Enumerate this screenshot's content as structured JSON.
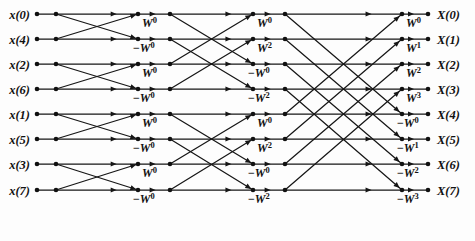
{
  "figure": {
    "name": "fft-butterfly-diagram",
    "width": 475,
    "height": 241,
    "background_color": "#fdfdfd",
    "line_color": "#161616",
    "text_color": "#111111"
  },
  "chart_data": {
    "type": "diagram",
    "n_points": 8,
    "n_stages": 3,
    "inputs": [
      "x(0)",
      "x(4)",
      "x(2)",
      "x(6)",
      "x(1)",
      "x(5)",
      "x(3)",
      "x(7)"
    ],
    "outputs": [
      "X(0)",
      "X(1)",
      "X(2)",
      "X(3)",
      "X(4)",
      "X(5)",
      "X(6)",
      "X(7)"
    ],
    "input_order": "bit-reversed",
    "output_order": "natural",
    "stages": [
      {
        "index": 1,
        "butterfly_span": 1,
        "twiddle_labels": [
          "W^0",
          "-W^0",
          "W^0",
          "-W^0",
          "W^0",
          "-W^0",
          "W^0",
          "-W^0"
        ]
      },
      {
        "index": 2,
        "butterfly_span": 2,
        "twiddle_labels": [
          "W^0",
          "W^2",
          "-W^0",
          "-W^2",
          "W^0",
          "W^2",
          "-W^0",
          "-W^2"
        ]
      },
      {
        "index": 3,
        "butterfly_span": 4,
        "twiddle_labels": [
          "W^0",
          "W^1",
          "W^2",
          "W^3",
          "-W^0",
          "-W^1",
          "-W^2",
          "-W^3"
        ]
      }
    ],
    "twiddle_rows": {
      "stage1": [
        {
          "sign": "",
          "base": "W",
          "exp": "0"
        },
        {
          "sign": "−",
          "base": "W",
          "exp": "0"
        },
        {
          "sign": "",
          "base": "W",
          "exp": "0"
        },
        {
          "sign": "−",
          "base": "W",
          "exp": "0"
        },
        {
          "sign": "",
          "base": "W",
          "exp": "0"
        },
        {
          "sign": "−",
          "base": "W",
          "exp": "0"
        },
        {
          "sign": "",
          "base": "W",
          "exp": "0"
        },
        {
          "sign": "−",
          "base": "W",
          "exp": "0"
        }
      ],
      "stage2": [
        {
          "sign": "",
          "base": "W",
          "exp": "0"
        },
        {
          "sign": "",
          "base": "W",
          "exp": "2"
        },
        {
          "sign": "−",
          "base": "W",
          "exp": "0"
        },
        {
          "sign": "−",
          "base": "W",
          "exp": "2"
        },
        {
          "sign": "",
          "base": "W",
          "exp": "0"
        },
        {
          "sign": "",
          "base": "W",
          "exp": "2"
        },
        {
          "sign": "−",
          "base": "W",
          "exp": "0"
        },
        {
          "sign": "−",
          "base": "W",
          "exp": "2"
        }
      ],
      "stage3": [
        {
          "sign": "",
          "base": "W",
          "exp": "0"
        },
        {
          "sign": "",
          "base": "W",
          "exp": "1"
        },
        {
          "sign": "",
          "base": "W",
          "exp": "2"
        },
        {
          "sign": "",
          "base": "W",
          "exp": "3"
        },
        {
          "sign": "−",
          "base": "W",
          "exp": "0"
        },
        {
          "sign": "−",
          "base": "W",
          "exp": "1"
        },
        {
          "sign": "−",
          "base": "W",
          "exp": "2"
        },
        {
          "sign": "−",
          "base": "W",
          "exp": "3"
        }
      ]
    },
    "geometry": {
      "row_y": [
        14,
        39,
        64,
        89,
        114,
        139,
        164,
        190
      ],
      "input_label_x": 30,
      "columns_x": [
        37,
        56,
        138,
        170,
        235,
        253,
        285,
        402,
        428
      ],
      "output_label_x": 437,
      "stage_in_x": [
        56,
        170,
        285
      ],
      "stage_out_x": [
        138,
        253,
        402
      ],
      "dot_radius": 2.3,
      "twiddle_dx": 4,
      "twiddle_dy": 13
    }
  }
}
